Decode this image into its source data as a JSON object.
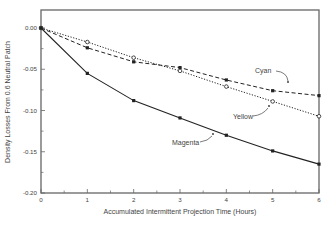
{
  "chart_data": {
    "type": "line",
    "title": "",
    "xlabel": "Accumulated Intermittent Projection Time (Hours)",
    "ylabel": "Density Losses From 0.6 Neutral Patch",
    "xlim": [
      0,
      6
    ],
    "ylim": [
      -0.2,
      0.0
    ],
    "x_ticks": [
      0,
      1,
      2,
      3,
      4,
      5,
      6
    ],
    "x_tick_labels": [
      "0",
      "1",
      "2",
      "3",
      "4",
      "5",
      "6"
    ],
    "y_ticks": [
      0.0,
      -0.05,
      -0.1,
      -0.15,
      -0.2
    ],
    "y_tick_labels": [
      "0.00",
      "-0.05",
      "-0.10",
      "-0.15",
      "-0.20"
    ],
    "grid": false,
    "legend": "inline annotations with arrows",
    "x": [
      0,
      1,
      2,
      3,
      4,
      5,
      6
    ],
    "series": [
      {
        "name": "Cyan",
        "line_style": "dashed",
        "marker": "filled-square",
        "color": "#222222",
        "values": [
          0.0,
          -0.024,
          -0.041,
          -0.048,
          -0.063,
          -0.076,
          -0.082
        ]
      },
      {
        "name": "Yellow",
        "line_style": "dotted",
        "marker": "open-circle",
        "color": "#222222",
        "values": [
          0.0,
          -0.017,
          -0.036,
          -0.052,
          -0.071,
          -0.089,
          -0.107
        ]
      },
      {
        "name": "Magenta",
        "line_style": "solid",
        "marker": "filled-square",
        "color": "#222222",
        "values": [
          0.0,
          -0.055,
          -0.088,
          -0.109,
          -0.13,
          -0.149,
          -0.165
        ]
      }
    ],
    "annotations": [
      {
        "text": "Cyan",
        "target_series": "Cyan"
      },
      {
        "text": "Yellow",
        "target_series": "Yellow"
      },
      {
        "text": "Magenta",
        "target_series": "Magenta"
      }
    ]
  }
}
